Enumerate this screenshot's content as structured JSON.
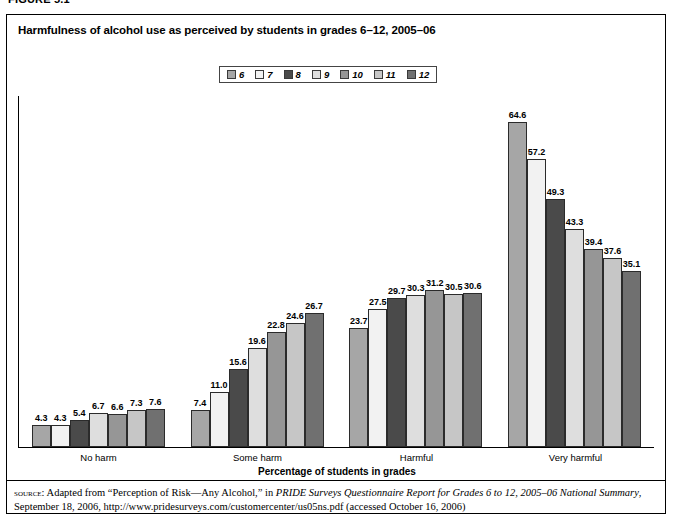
{
  "figure": {
    "label": "FIGURE 5.1"
  },
  "chart_title": "Harmfulness of alcohol use as perceived by students in grades 6–12, 2005–06",
  "x_axis_title": "Percentage of students in grades",
  "source": {
    "prefix": "source:",
    "line1_a": " Adapted from “Perception of Risk—Any Alcohol,” in ",
    "line1_italic": "PRIDE Surveys Questionnaire Report for Grades 6 to 12, 2005–06 National Summary",
    "line1_b": ",",
    "line2": "September 18, 2006, http://www.pridesurveys.com/customercenter/us05ns.pdf (accessed October 16, 2006)"
  },
  "legend": {
    "position": "top-center",
    "items": [
      {
        "label": "6",
        "color": "#a6a6a6"
      },
      {
        "label": "7",
        "color": "#f2f2f2"
      },
      {
        "label": "8",
        "color": "#4a4a4a"
      },
      {
        "label": "9",
        "color": "#dedede"
      },
      {
        "label": "10",
        "color": "#969696"
      },
      {
        "label": "11",
        "color": "#c6c6c6"
      },
      {
        "label": "12",
        "color": "#707070"
      }
    ]
  },
  "chart_data": {
    "type": "bar",
    "title": "Harmfulness of alcohol use as perceived by students in grades 6–12, 2005–06",
    "xlabel": "Percentage of students in grades",
    "ylabel": "",
    "ylim": [
      0,
      70
    ],
    "grid": false,
    "legend_position": "top-center",
    "categories": [
      "No harm",
      "Some harm",
      "Harmful",
      "Very harmful"
    ],
    "series": [
      {
        "name": "6",
        "color": "#a6a6a6",
        "values": [
          4.3,
          7.4,
          23.7,
          64.6
        ]
      },
      {
        "name": "7",
        "color": "#f2f2f2",
        "values": [
          4.3,
          11.0,
          27.5,
          57.2
        ]
      },
      {
        "name": "8",
        "color": "#4a4a4a",
        "values": [
          5.4,
          15.6,
          29.7,
          49.3
        ]
      },
      {
        "name": "9",
        "color": "#dedede",
        "values": [
          6.7,
          19.6,
          30.3,
          43.3
        ]
      },
      {
        "name": "10",
        "color": "#969696",
        "values": [
          6.6,
          22.8,
          31.2,
          39.4
        ]
      },
      {
        "name": "11",
        "color": "#c6c6c6",
        "values": [
          7.3,
          24.6,
          30.5,
          37.6
        ]
      },
      {
        "name": "12",
        "color": "#707070",
        "values": [
          7.6,
          26.7,
          30.6,
          35.1
        ]
      }
    ]
  }
}
